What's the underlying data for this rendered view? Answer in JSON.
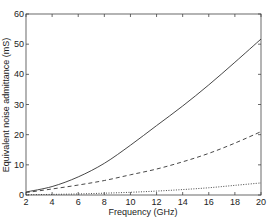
{
  "chart_data": {
    "type": "line",
    "title": "",
    "xlabel": "Frequency  (GHz)",
    "ylabel": "Equivalent noise admittance  (mS)",
    "xlim": [
      2,
      20
    ],
    "ylim": [
      0,
      60
    ],
    "xticks": [
      2,
      4,
      6,
      8,
      10,
      12,
      14,
      16,
      18,
      20
    ],
    "yticks": [
      0,
      10,
      20,
      30,
      40,
      50,
      60
    ],
    "grid": false,
    "legend": null,
    "x": [
      2,
      4,
      6,
      8,
      10,
      12,
      14,
      16,
      18,
      20
    ],
    "series": [
      {
        "name": "solid",
        "style": "solid",
        "values": [
          1.0,
          2.8,
          6.0,
          10.5,
          16.5,
          23.0,
          29.5,
          36.5,
          44.0,
          51.7
        ]
      },
      {
        "name": "dashed",
        "style": "dashed",
        "values": [
          0.8,
          2.0,
          3.3,
          4.8,
          6.7,
          8.6,
          11.0,
          13.8,
          17.2,
          21.0
        ]
      },
      {
        "name": "dotted",
        "style": "dotted",
        "values": [
          0.1,
          0.2,
          0.35,
          0.6,
          0.9,
          1.3,
          1.8,
          2.4,
          3.2,
          4.0
        ]
      }
    ]
  },
  "colors": {
    "line": "#333333",
    "axis": "#444444",
    "background": "#ffffff"
  }
}
